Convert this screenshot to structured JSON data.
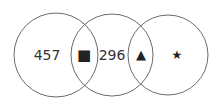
{
  "diagram": {
    "type": "venn",
    "circles": [
      {
        "cx": 56,
        "cy": 55,
        "r": 42
      },
      {
        "cx": 112,
        "cy": 55,
        "r": 41
      },
      {
        "cx": 168,
        "cy": 55,
        "r": 40
      }
    ],
    "stroke_color": "#6b6b6b",
    "regions": {
      "left_only": "457",
      "left_middle_overlap": "■",
      "middle_only": "296",
      "middle_right_overlap": "▲",
      "right_only": "★"
    },
    "icons": {
      "left_middle_overlap": "square-icon",
      "middle_right_overlap": "triangle-icon",
      "right_only": "star-icon"
    }
  }
}
